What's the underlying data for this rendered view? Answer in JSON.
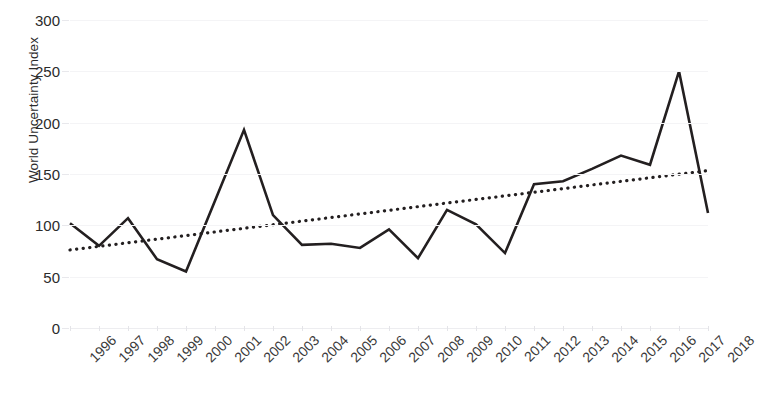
{
  "chart_data": {
    "type": "line",
    "title": "",
    "xlabel": "",
    "ylabel": "World Uncertainty Index",
    "ylim": [
      0,
      300
    ],
    "yticks": [
      0,
      50,
      100,
      150,
      200,
      250,
      300
    ],
    "ytick_labels": [
      "0",
      "50",
      "100",
      "150",
      "200",
      "250",
      "300"
    ],
    "grid": true,
    "legend": "none",
    "categories": [
      "1996",
      "1997",
      "1998",
      "1999",
      "2000",
      "2001",
      "2002",
      "2003",
      "2004",
      "2005",
      "2006",
      "2007",
      "2008",
      "2009",
      "2010",
      "2011",
      "2012",
      "2013",
      "2014",
      "2015",
      "2016",
      "2017",
      "2018"
    ],
    "series": [
      {
        "name": "World Uncertainty Index",
        "style": "solid",
        "color": "#231f20",
        "values": [
          102,
          80,
          107,
          67,
          55,
          124,
          193,
          110,
          81,
          82,
          78,
          96,
          68,
          115,
          101,
          73,
          140,
          143,
          155,
          168,
          159,
          250,
          112
        ]
      },
      {
        "name": "Linear trend",
        "style": "dotted",
        "color": "#231f20",
        "values": [
          76,
          79.5,
          83,
          86.5,
          90,
          93.6,
          97.1,
          100.6,
          104.1,
          107.6,
          111.1,
          114.6,
          118.2,
          121.7,
          125.2,
          128.7,
          132.2,
          135.7,
          139.3,
          142.8,
          146.3,
          149.8,
          153.3
        ]
      }
    ],
    "annotations": []
  }
}
